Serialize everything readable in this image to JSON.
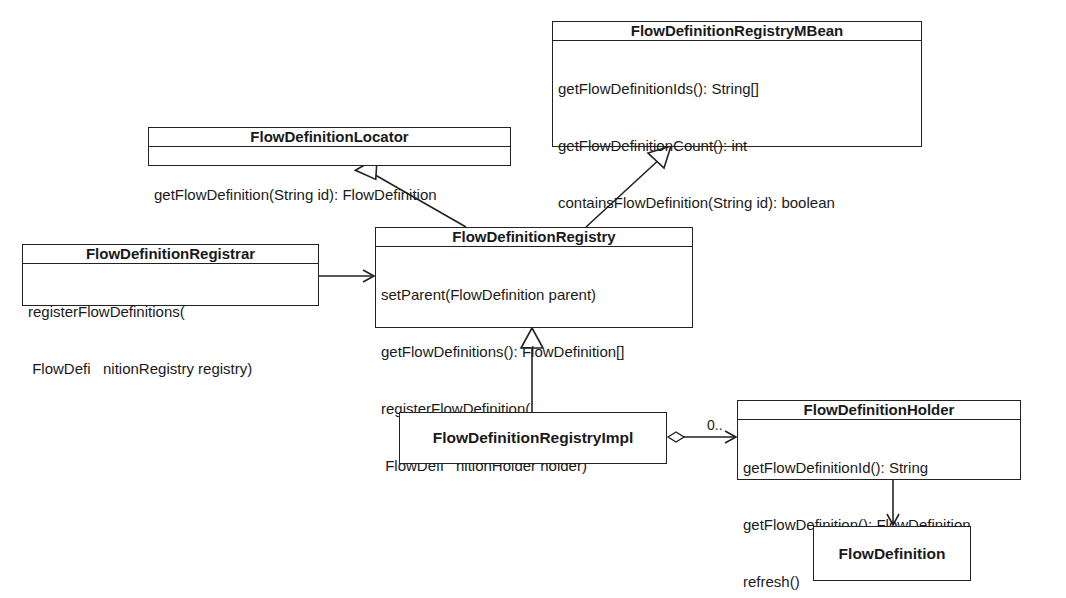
{
  "classes": {
    "mbean": {
      "name": "FlowDefinitionRegistryMBean",
      "operations": [
        "getFlowDefinitionIds(): String[]",
        "getFlowDefinitionCount(): int",
        "containsFlowDefinition(String id): boolean",
        "refresh()",
        "refresh(String id)"
      ]
    },
    "locator": {
      "name": "FlowDefinitionLocator",
      "operations": [
        "getFlowDefinition(String id): FlowDefinition"
      ]
    },
    "registrar": {
      "name": "FlowDefinitionRegistrar",
      "operations": [
        "registerFlowDefinitions(",
        " FlowDefi   nitionRegistry registry)"
      ]
    },
    "registry": {
      "name": "FlowDefinitionRegistry",
      "operations": [
        "setParent(FlowDefinition parent)",
        "getFlowDefinitions(): FlowDefinition[]",
        "registerFlowDefinition(",
        " FlowDefi   nitionHolder holder)"
      ]
    },
    "impl": {
      "name": "FlowDefinitionRegistryImpl"
    },
    "holder": {
      "name": "FlowDefinitionHolder",
      "operations": [
        "getFlowDefinitionId(): String",
        "getFlowDefinition(): FlowDefinition",
        "refresh()"
      ]
    },
    "definition": {
      "name": "FlowDefinition"
    }
  },
  "relationships": [
    {
      "from": "registry",
      "to": "locator",
      "type": "generalization"
    },
    {
      "from": "registry",
      "to": "mbean",
      "type": "generalization"
    },
    {
      "from": "registrar",
      "to": "registry",
      "type": "dependency"
    },
    {
      "from": "impl",
      "to": "registry",
      "type": "realization"
    },
    {
      "from": "impl",
      "to": "holder",
      "type": "aggregation",
      "multiplicity": "0.."
    },
    {
      "from": "holder",
      "to": "definition",
      "type": "association"
    }
  ],
  "labels": {
    "impl_holder_multiplicity": "0.."
  },
  "colors": {
    "line": "#222222",
    "background": "#ffffff",
    "text": "#1a1a1a"
  }
}
